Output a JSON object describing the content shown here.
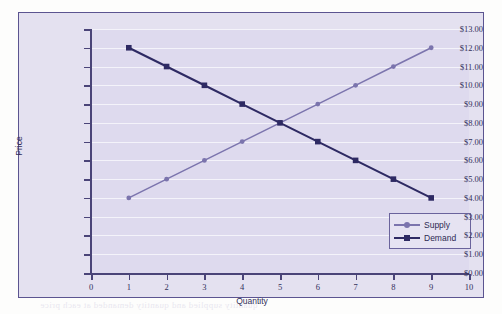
{
  "chart_data": {
    "type": "line",
    "title": "",
    "xlabel": "Quantity",
    "ylabel": "Price",
    "x": [
      1,
      2,
      3,
      4,
      5,
      6,
      7,
      8,
      9
    ],
    "xlim": [
      0,
      10
    ],
    "ylim": [
      0,
      13
    ],
    "grid": true,
    "legend_position": "bottom-right",
    "x_tick_labels": [
      "0",
      "1",
      "2",
      "3",
      "4",
      "5",
      "6",
      "7",
      "8",
      "9",
      "10"
    ],
    "y_tick_labels": [
      "$13.00",
      "$12.00",
      "$11.00",
      "$10.00",
      "$9.00",
      "$8.00",
      "$7.00",
      "$6.00",
      "$5.00",
      "$4.00",
      "$3.00",
      "$2.00",
      "$1.00",
      "$0.00"
    ],
    "y_tick_values": [
      13,
      12,
      11,
      10,
      9,
      8,
      7,
      6,
      5,
      4,
      3,
      2,
      1,
      0
    ],
    "series": [
      {
        "name": "Supply",
        "color": "#7b74ad",
        "marker": "circle",
        "values": [
          4,
          5,
          6,
          7,
          8,
          9,
          10,
          11,
          12
        ]
      },
      {
        "name": "Demand",
        "color": "#2e2a63",
        "marker": "square",
        "values": [
          12,
          11,
          10,
          9,
          8,
          7,
          6,
          5,
          4
        ]
      }
    ],
    "equilibrium": {
      "quantity": 5,
      "price": 8
    }
  },
  "legend": {
    "items": [
      {
        "label": "Supply",
        "color": "#7b74ad",
        "marker": "circle-marker"
      },
      {
        "label": "Demand",
        "color": "#2e2a63",
        "marker": "square-marker"
      }
    ]
  },
  "colors": {
    "plot_background": "#dedaee",
    "frame_background": "#e4e1f0",
    "frame_border": "#5b5490",
    "gridline": "#f4f3fa",
    "axis": "#4a4478",
    "supply": "#7b74ad",
    "demand": "#2e2a63",
    "text": "#33305a"
  },
  "bleed_text": {
    "line1": "demand schedule and",
    "line2": "the market for",
    "line3": "equilibrium price and",
    "line4": "quantity supplied and quantity demanded at each price"
  }
}
